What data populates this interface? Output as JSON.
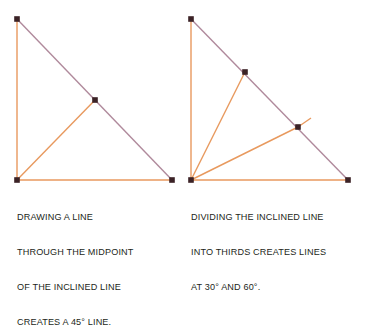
{
  "figure": {
    "background": "#ffffff",
    "colors": {
      "leg": "#e8995e",
      "interior": "#e8995e",
      "hypotenuse": "#b08a9c",
      "vertex_marker": "#3b2226",
      "caption_text": "#231f20"
    },
    "panels": [
      {
        "id": "left",
        "name": "midpoint-construction",
        "caption": {
          "lines": [
            "DRAWING A LINE",
            "THROUGH THE MIDPOINT",
            "OF THE INCLINED LINE",
            "CREATES A 45° LINE."
          ]
        },
        "geometry": {
          "apex": {
            "x": 17,
            "y": 19
          },
          "bottom_left": {
            "x": 17,
            "y": 180
          },
          "bottom_right": {
            "x": 172,
            "y": 180
          },
          "points": [
            {
              "name": "midpoint-of-hypotenuse",
              "x": 95,
              "y": 100,
              "fraction": 0.5
            }
          ],
          "constructed_lines": [
            {
              "name": "forty-five-degree-line",
              "from": "bottom_left",
              "to": "midpoint",
              "angle": "45°"
            }
          ],
          "markers": [
            {
              "x": 17,
              "y": 19
            },
            {
              "x": 17,
              "y": 180
            },
            {
              "x": 172,
              "y": 180
            },
            {
              "x": 95,
              "y": 100
            }
          ]
        }
      },
      {
        "id": "right",
        "name": "thirds-construction",
        "caption": {
          "lines": [
            "DIVIDING THE INCLINED LINE",
            "INTO THIRDS CREATES LINES",
            "AT 30° AND 60°."
          ]
        },
        "geometry": {
          "apex": {
            "x": 8,
            "y": 19
          },
          "bottom_left": {
            "x": 8,
            "y": 180
          },
          "bottom_right": {
            "x": 165,
            "y": 180
          },
          "points": [
            {
              "name": "first-third-point",
              "x": 62,
              "y": 72,
              "fraction": 0.3333,
              "angle": "60°"
            },
            {
              "name": "second-third-point",
              "x": 115,
              "y": 127,
              "fraction": 0.6667,
              "angle": "30°"
            }
          ],
          "constructed_lines": [
            {
              "name": "sixty-degree-line",
              "from": "bottom_left",
              "to": "first-third-point",
              "angle": "60°"
            },
            {
              "name": "thirty-degree-line",
              "from": "bottom_left",
              "to": "second-third-point",
              "angle": "30°"
            }
          ],
          "overshoot_stub": {
            "from": {
              "x": 115,
              "y": 127
            },
            "to": {
              "x": 128,
              "y": 118
            }
          },
          "markers": [
            {
              "x": 8,
              "y": 19
            },
            {
              "x": 8,
              "y": 180
            },
            {
              "x": 165,
              "y": 180
            },
            {
              "x": 62,
              "y": 72
            },
            {
              "x": 115,
              "y": 127
            }
          ]
        }
      }
    ]
  }
}
